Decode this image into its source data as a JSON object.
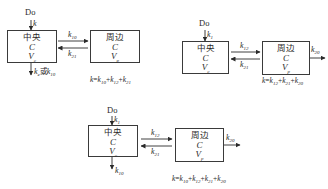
{
  "diagrams": [
    {
      "id": "model-1",
      "dose_label": "Do",
      "input_rate": {
        "k": "k",
        "sub": ""
      },
      "central": {
        "name": "中央",
        "c": "C",
        "v": "V",
        "v_sub": "c"
      },
      "peripheral": {
        "name": "周边",
        "c": "C",
        "v": "V",
        "v_sub": "p"
      },
      "forward_rate": {
        "k": "k",
        "sub": "10"
      },
      "backward_rate": {
        "k": "k",
        "sub": "21"
      },
      "elimination": {
        "k": "k",
        "sub": "e",
        "or": "或",
        "k2": "k",
        "sub2": "10"
      },
      "formula": {
        "lhs": "k",
        "terms": [
          {
            "k": "k",
            "sub": "10"
          },
          {
            "k": "k",
            "sub": "12"
          },
          {
            "k": "k",
            "sub": "21"
          }
        ]
      }
    },
    {
      "id": "model-2",
      "dose_label": "Do",
      "input_rate": {
        "k": "k",
        "sub": "1"
      },
      "central": {
        "name": "中央",
        "c": "C",
        "v": "V",
        "v_sub": "c"
      },
      "peripheral": {
        "name": "周边",
        "c": "C",
        "v": "V",
        "v_sub": "p"
      },
      "forward_rate": {
        "k": "k",
        "sub": "12"
      },
      "backward_rate": {
        "k": "k",
        "sub": "21"
      },
      "peripheral_elimination": {
        "k": "k",
        "sub": "20"
      },
      "formula": {
        "lhs": "k",
        "terms": [
          {
            "k": "k",
            "sub": "12"
          },
          {
            "k": "k",
            "sub": "21"
          },
          {
            "k": "k",
            "sub": "20"
          }
        ]
      }
    },
    {
      "id": "model-3",
      "dose_label": "Do",
      "input_rate": {
        "k": "k",
        "sub": "1"
      },
      "central": {
        "name": "中央",
        "c": "C",
        "v": "V",
        "v_sub": "c"
      },
      "peripheral": {
        "name": "周边",
        "c": "C",
        "v": "V",
        "v_sub": "p"
      },
      "forward_rate": {
        "k": "k",
        "sub": "12"
      },
      "backward_rate": {
        "k": "k",
        "sub": "21"
      },
      "central_elimination": {
        "k": "k",
        "sub": "10"
      },
      "peripheral_elimination": {
        "k": "k",
        "sub": "20"
      },
      "formula": {
        "lhs": "k",
        "terms": [
          {
            "k": "k",
            "sub": "10"
          },
          {
            "k": "k",
            "sub": "12"
          },
          {
            "k": "k",
            "sub": "21"
          },
          {
            "k": "k",
            "sub": "20"
          }
        ]
      }
    }
  ],
  "formula_ops": {
    "eq": "=",
    "plus": "+"
  }
}
